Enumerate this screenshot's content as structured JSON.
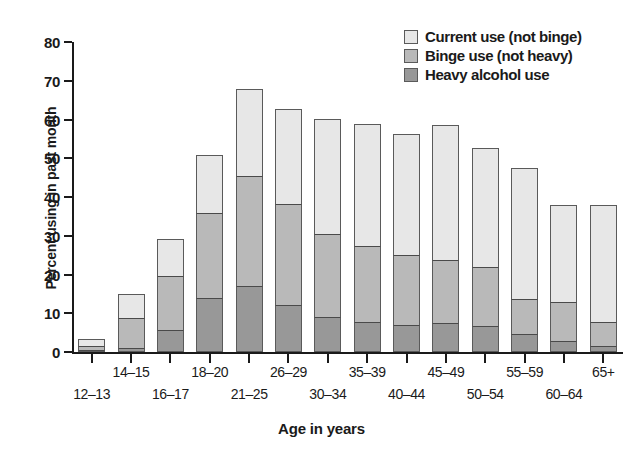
{
  "chart_data": {
    "type": "bar",
    "title": "",
    "subtitle": "",
    "xlabel": "Age in years",
    "ylabel": "Percent using in past month",
    "ylim": [
      0,
      80
    ],
    "yticks": [
      0,
      10,
      20,
      30,
      40,
      50,
      60,
      70,
      80
    ],
    "grid": false,
    "stacked": true,
    "legend_position": "top-right",
    "categories": [
      "12–13",
      "14–15",
      "16–17",
      "18–20",
      "21–25",
      "26–29",
      "30–34",
      "35–39",
      "40–44",
      "45–49",
      "50–54",
      "55–59",
      "60–64",
      "65+"
    ],
    "series": [
      {
        "name": "Heavy alcohol use",
        "color": "#989898",
        "values": [
          0.5,
          1.0,
          5.7,
          14.0,
          17.0,
          12.2,
          9.0,
          7.8,
          7.0,
          7.5,
          6.8,
          4.7,
          2.8,
          1.5
        ]
      },
      {
        "name": "Binge use (not heavy)",
        "color": "#b9b9b9",
        "values": [
          1.3,
          8.0,
          14.3,
          22.2,
          28.8,
          26.2,
          21.6,
          19.8,
          18.4,
          16.5,
          15.3,
          9.3,
          10.3,
          6.5
        ]
      },
      {
        "name": "Current use (not binge)",
        "color": "#e7e7e7",
        "values": [
          2.1,
          6.6,
          9.8,
          15.1,
          22.5,
          24.9,
          30.0,
          31.7,
          31.3,
          35.2,
          31.1,
          39.2,
          34.9,
          30.5
        ]
      }
    ],
    "cumulative_levels": {
      "heavy": [
        0.5,
        1.0,
        5.7,
        14.0,
        17.0,
        12.2,
        9.0,
        7.8,
        7.0,
        7.5,
        6.8,
        4.7,
        2.8,
        1.5
      ],
      "binge_top": [
        1.8,
        9.0,
        20.0,
        36.2,
        45.8,
        38.4,
        30.6,
        27.6,
        25.4,
        24.0,
        22.1,
        14.0,
        13.1,
        8.0
      ],
      "total": [
        3.9,
        15.6,
        29.8,
        51.3,
        68.3,
        63.3,
        60.6,
        59.3,
        56.7,
        59.2,
        53.2,
        48.0,
        38.5,
        38.5
      ]
    },
    "totals": [
      3.9,
      15.6,
      29.8,
      51.3,
      68.3,
      63.3,
      60.6,
      59.3,
      56.7,
      59.2,
      53.2,
      48.0,
      38.5,
      38.5
    ]
  },
  "legend": {
    "items": [
      {
        "label": "Current use (not binge)",
        "color": "#e7e7e7"
      },
      {
        "label": "Binge use (not heavy)",
        "color": "#b9b9b9"
      },
      {
        "label": "Heavy alcohol use",
        "color": "#989898"
      }
    ]
  },
  "axes": {
    "y_title": "Percent using in past month",
    "x_title": "Age in years",
    "y_tick_labels": [
      "0",
      "10",
      "20",
      "30",
      "40",
      "50",
      "60",
      "70",
      "80"
    ],
    "x_tick_labels": [
      "12–13",
      "14–15",
      "16–17",
      "18–20",
      "21–25",
      "26–29",
      "30–34",
      "35–39",
      "40–44",
      "45–49",
      "50–54",
      "55–59",
      "60–64",
      "65+"
    ]
  }
}
